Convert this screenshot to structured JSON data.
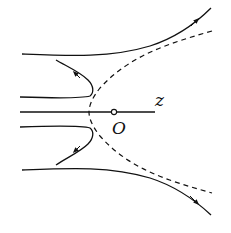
{
  "diagram": {
    "type": "field-lines-hyperbola",
    "labels": {
      "axis": "z",
      "origin": "O"
    },
    "elements": [
      {
        "kind": "axis-line",
        "description": "horizontal line through origin, labeled z"
      },
      {
        "kind": "origin-point",
        "description": "small hollow circle labeled O"
      },
      {
        "kind": "dashed-hyperbola",
        "description": "dashed curve opening to the right, vertex left of O"
      },
      {
        "kind": "field-line",
        "position": "upper-outer",
        "arrow": "outward up-right"
      },
      {
        "kind": "field-line",
        "position": "upper-inner",
        "arrow": "up-left after hitting hyperbola"
      },
      {
        "kind": "field-line",
        "position": "lower-inner",
        "arrow": "down-left after hitting hyperbola"
      },
      {
        "kind": "field-line",
        "position": "lower-outer",
        "arrow": "outward down-right"
      }
    ],
    "colors": {
      "stroke": "#111111",
      "background": "#ffffff"
    }
  }
}
